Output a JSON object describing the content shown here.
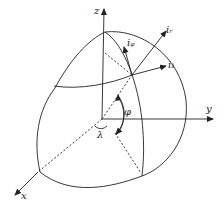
{
  "diagram": {
    "type": "spherical coordinate diagram",
    "axes": {
      "x": "x",
      "y": "y",
      "z": "z"
    },
    "angles": {
      "phi": "φ",
      "lambda": "λ"
    },
    "unit_vectors": [
      {
        "base": "i",
        "sub": "r"
      },
      {
        "base": "i",
        "sub": "φ"
      },
      {
        "base": "i",
        "sub": "λ"
      }
    ],
    "colors": {
      "stroke": "#222222",
      "background": "#ffffff"
    }
  }
}
